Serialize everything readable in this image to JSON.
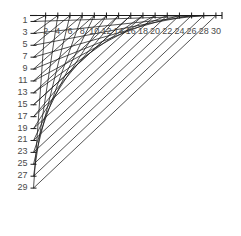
{
  "chart_data": {
    "type": "line",
    "title": "",
    "subtitle": "",
    "xlabel": "",
    "ylabel": "",
    "grid": false,
    "legend": null,
    "xlim": [
      0,
      31
    ],
    "ylim": [
      0,
      31
    ],
    "y_axis_inverted": true,
    "x_ticks": [
      2,
      4,
      6,
      8,
      10,
      12,
      14,
      16,
      18,
      20,
      22,
      24,
      26,
      28,
      30
    ],
    "x_tick_labels": [
      "2",
      "4",
      "6",
      "8",
      "10",
      "12",
      "14",
      "16",
      "18",
      "20",
      "22",
      "24",
      "26",
      "28",
      "30"
    ],
    "y_ticks": [
      1,
      3,
      5,
      7,
      9,
      11,
      13,
      15,
      17,
      19,
      21,
      23,
      25,
      27,
      29
    ],
    "y_tick_labels": [
      "1",
      "3",
      "5",
      "7",
      "9",
      "11",
      "13",
      "15",
      "17",
      "19",
      "21",
      "23",
      "25",
      "27",
      "29"
    ],
    "x_tick_step": 2,
    "y_tick_step": 2,
    "axis_color": "#1a1a1a",
    "line_color": "#1a1a1a",
    "tick_label_color": "#4a4a4a",
    "background_color": "#ffffff",
    "series": [
      {
        "name": "family-a",
        "type": "segments",
        "count": 15,
        "rule": "segment k joins (0, k) on the y-axis to (31-k, 0) on the x-axis, for k = 1..15 stepping by 1 in plot units of 2",
        "y_starts": [
          1,
          3,
          5,
          7,
          9,
          11,
          13,
          15,
          17,
          19,
          21,
          23,
          25,
          27,
          29
        ],
        "x_ends": [
          30,
          28,
          26,
          24,
          22,
          20,
          18,
          16,
          14,
          12,
          10,
          8,
          6,
          4,
          2
        ]
      },
      {
        "name": "family-b",
        "type": "segments",
        "count": 15,
        "rule": "mirrored family of chords producing the crossing mesh and a denser envelope near the curve",
        "y_starts": [
          1,
          3,
          5,
          7,
          9,
          11,
          13,
          15,
          17,
          19,
          21,
          23,
          25,
          27,
          29
        ],
        "x_ends": [
          2,
          4,
          6,
          8,
          10,
          12,
          14,
          16,
          18,
          20,
          22,
          24,
          26,
          28,
          30
        ]
      }
    ],
    "envelope": {
      "name": "envelope-curve",
      "kind": "hyperbola",
      "equation": "sqrt(x/31) + sqrt(y/31) = 1",
      "points": [
        [
          0.6,
          29.0
        ],
        [
          1.0,
          25.6
        ],
        [
          1.5,
          23.0
        ],
        [
          2.0,
          20.9
        ],
        [
          3.0,
          17.7
        ],
        [
          4.0,
          15.2
        ],
        [
          5.0,
          13.2
        ],
        [
          6.0,
          11.5
        ],
        [
          8.0,
          8.7
        ],
        [
          10.0,
          6.5
        ],
        [
          12.0,
          4.8
        ],
        [
          14.0,
          3.4
        ],
        [
          16.0,
          2.3
        ],
        [
          18.0,
          1.5
        ],
        [
          20.0,
          0.9
        ],
        [
          22.0,
          0.45
        ],
        [
          24.0,
          0.2
        ],
        [
          26.0,
          0.05
        ],
        [
          28.0,
          0.0
        ],
        [
          30.0,
          0.0
        ]
      ]
    }
  },
  "axes": {
    "y_axis_name": "vertical-axis",
    "x_axis_name": "horizontal-axis"
  }
}
